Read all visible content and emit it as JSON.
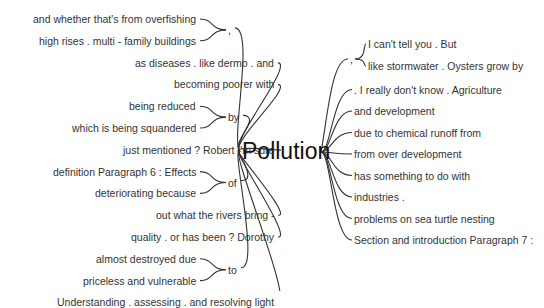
{
  "root": "Pollution",
  "left": [
    {
      "connector": ",",
      "children": [
        "and whether that's from overfishing",
        "high rises . multi - family buildings"
      ]
    },
    {
      "text": "as diseases . like dermo . and"
    },
    {
      "text": "becoming poorer with"
    },
    {
      "connector": "by",
      "children": [
        "being reduced",
        "which is being squandered"
      ]
    },
    {
      "text": "just mentioned ? Robert I'm sure"
    },
    {
      "connector": "of",
      "children": [
        "definition Paragraph 6 : Effects",
        "deteriorating because"
      ]
    },
    {
      "text": "out what the rivers bring -"
    },
    {
      "text": "quality . or has been ? Dorothy"
    },
    {
      "connector": "to",
      "children": [
        "almost destroyed due",
        "priceless and vulnerable"
      ]
    },
    {
      "text": "Understanding . assessing . and resolving light"
    }
  ],
  "right": [
    {
      "connector": ",",
      "children": [
        "I can't tell you . But",
        "like stormwater . Oysters grow by"
      ]
    },
    {
      "text": ". I really don't know . Agriculture"
    },
    {
      "text": "and development"
    },
    {
      "text": "due to chemical runoff from"
    },
    {
      "text": "from over development"
    },
    {
      "text": "has something to do with"
    },
    {
      "text": "industries ."
    },
    {
      "text": "problems on sea turtle nesting"
    },
    {
      "text": "Section and introduction Paragraph 7 :"
    }
  ]
}
